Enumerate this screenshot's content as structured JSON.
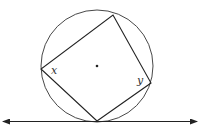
{
  "diagram": {
    "labels": {
      "x": "x",
      "y": "y"
    },
    "colors": {
      "stroke": "#222222",
      "background": "#ffffff"
    }
  }
}
